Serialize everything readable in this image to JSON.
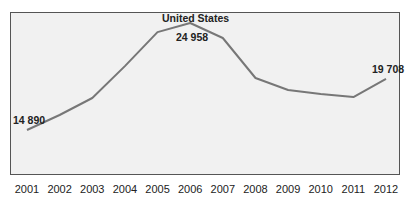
{
  "chart_data": {
    "type": "line",
    "title": "United States",
    "subtitle_cut_off": "",
    "xlabel": "",
    "ylabel": "",
    "categories": [
      "2001",
      "2002",
      "2003",
      "2004",
      "2005",
      "2006",
      "2007",
      "2008",
      "2009",
      "2010",
      "2011",
      "2012"
    ],
    "series": [
      {
        "name": "United States",
        "color": "#777777",
        "values": [
          14890,
          16300,
          17900,
          20900,
          24100,
          24958,
          23550,
          19780,
          18650,
          18280,
          17990,
          19708
        ]
      }
    ],
    "data_labels": [
      {
        "category": "2001",
        "text": "14 890"
      },
      {
        "category": "2006",
        "text": "24 958"
      },
      {
        "category": "2012",
        "text": "19 708"
      }
    ],
    "grid": false,
    "legend": "none",
    "ylim": [
      11000,
      27000
    ]
  },
  "labels": {
    "series_title": "United States",
    "first_value": "14 890",
    "peak_value": "24 958",
    "last_value": "19 708"
  },
  "style": {
    "line_color": "#777777",
    "plot_bg": "#f1f1f1",
    "border_color": "#555555"
  }
}
